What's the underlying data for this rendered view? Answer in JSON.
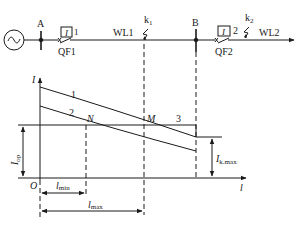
{
  "diagram": {
    "type": "protection-characteristic",
    "colors": {
      "line": "#1a1a1a",
      "background": "#ffffff"
    },
    "circuit": {
      "source_symbol": "~",
      "bus_a_label": "A",
      "bus_b_label": "B",
      "relay1": {
        "symbol": "I",
        "number": "1"
      },
      "relay2": {
        "symbol": "I",
        "number": "2"
      },
      "breaker1": "QF1",
      "breaker2": "QF2",
      "line1": "WL1",
      "line2": "WL2",
      "fault1": {
        "base": "k",
        "sub": "1"
      },
      "fault2": {
        "base": "k",
        "sub": "2"
      }
    },
    "plot": {
      "y_axis_label": "I",
      "x_axis_label": "l",
      "origin_label": "O",
      "curve1_label": "1",
      "curve2_label": "2",
      "line3_label": "3",
      "point_n": "N",
      "point_m": "M",
      "iop": {
        "base": "I",
        "sub": "op"
      },
      "ikmax": {
        "base": "I",
        "sub": "k.max"
      },
      "lmin": {
        "base": "l",
        "sub": "min"
      },
      "lmax": {
        "base": "l",
        "sub": "max"
      }
    }
  }
}
